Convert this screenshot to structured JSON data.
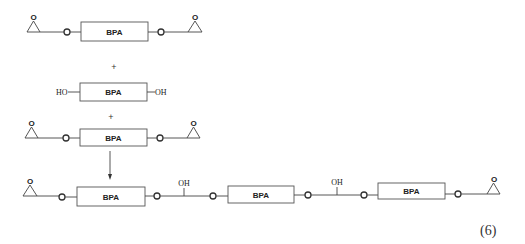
{
  "diagram": {
    "unit_label": "BPA",
    "ether_label": "O",
    "hydroxyl_left": "HO",
    "hydroxyl_right": "OH",
    "plus_sign": "+",
    "equation_number": "(6)",
    "reactants": [
      {
        "name": "BPA diglycidyl ether",
        "structure": "epoxide-O-[BPA]-O-epoxide"
      },
      {
        "name": "Bisphenol A",
        "structure": "HO-[BPA]-OH"
      },
      {
        "name": "BPA diglycidyl ether",
        "structure": "epoxide-O-[BPA]-O-epoxide"
      }
    ],
    "product": {
      "structure": "epoxide-O-[BPA]-O-CH(OH)-O-[BPA]-O-CH(OH)-O-[BPA]-O-epoxide",
      "branch_labels": [
        "OH",
        "OH"
      ]
    }
  }
}
